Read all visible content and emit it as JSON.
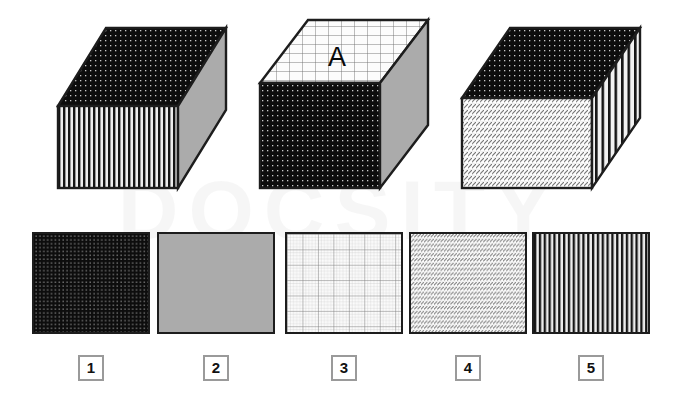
{
  "page": {
    "background_color": "#ffffff",
    "watermark_text": "DOCSITY"
  },
  "palette": {
    "ink": "#1d1d1d",
    "gray_face": "#ababab",
    "dark_dotted_base": "#0d0d0d",
    "dot_color": "#cfcfcf",
    "stripe_dark": "#111111",
    "stripe_light": "#e9e9e9",
    "grid_line": "#8f8f8f",
    "hatch_line": "#6d6d6d",
    "label_border": "#9a9a9a"
  },
  "boxes": [
    {
      "id": "box-1",
      "name": "box-left",
      "letter": "",
      "faces": {
        "top": "dark-dotted",
        "front": "vertical-stripes",
        "side": "solid-gray"
      }
    },
    {
      "id": "box-2",
      "name": "box-middle",
      "letter": "A",
      "faces": {
        "top": "fine-grid",
        "front": "dark-dotted",
        "side": "solid-gray"
      }
    },
    {
      "id": "box-3",
      "name": "box-right",
      "letter": "",
      "faces": {
        "top": "dark-dotted",
        "front": "diagonal-hatch",
        "side": "vertical-stripes"
      }
    }
  ],
  "options": [
    {
      "number": "1",
      "pattern": "dark-dotted",
      "pattern_label": "dark surface with light dots"
    },
    {
      "number": "2",
      "pattern": "solid-gray",
      "pattern_label": "solid gray"
    },
    {
      "number": "3",
      "pattern": "fine-grid",
      "pattern_label": "fine graph-paper grid"
    },
    {
      "number": "4",
      "pattern": "diagonal-hatch",
      "pattern_label": "rows of diagonal hatching"
    },
    {
      "number": "5",
      "pattern": "vertical-stripes",
      "pattern_label": "vertical stripes"
    }
  ]
}
